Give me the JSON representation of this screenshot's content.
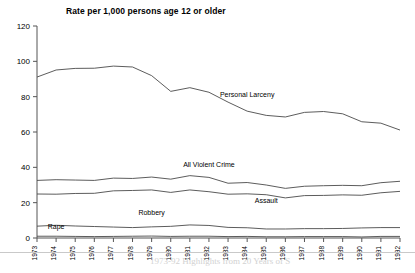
{
  "chart_data": {
    "type": "line",
    "title": "Rate per 1,000 persons age 12 or older",
    "xlabel": "",
    "ylabel": "",
    "ylim": [
      0,
      120
    ],
    "yticks": [
      0,
      20,
      40,
      60,
      80,
      100,
      120
    ],
    "grid": false,
    "legend": "inline-annotations",
    "categories": [
      "1973",
      "1974",
      "1975",
      "1976",
      "1977",
      "1978",
      "1979",
      "1980",
      "1981",
      "1982",
      "1983",
      "1984",
      "1985",
      "1986",
      "1987",
      "1988",
      "1989",
      "1990",
      "1991",
      "1992"
    ],
    "series": [
      {
        "name": "Personal Larceny",
        "values": [
          91.1,
          95.1,
          96.0,
          96.1,
          97.3,
          96.8,
          91.9,
          83.0,
          85.1,
          82.5,
          76.9,
          71.8,
          69.4,
          68.5,
          71.1,
          71.6,
          70.3,
          65.8,
          65.0,
          61.1
        ],
        "label_x_year": "1984",
        "label_value": 80
      },
      {
        "name": "All Violent Crime",
        "values": [
          32.6,
          33.0,
          32.8,
          32.6,
          33.9,
          33.7,
          34.5,
          33.3,
          35.3,
          34.3,
          31.0,
          31.4,
          30.0,
          28.1,
          29.3,
          29.6,
          29.8,
          29.6,
          31.3,
          32.1
        ],
        "label_x_year": "1982",
        "label_value": 40
      },
      {
        "name": "Assault",
        "values": [
          24.9,
          24.8,
          25.2,
          25.3,
          26.7,
          26.9,
          27.2,
          25.8,
          27.2,
          26.2,
          24.8,
          25.0,
          24.5,
          22.7,
          24.0,
          24.1,
          24.4,
          24.2,
          25.6,
          26.4
        ],
        "label_x_year": "1985",
        "label_value": 20
      },
      {
        "name": "Robbery",
        "values": [
          6.7,
          7.2,
          6.8,
          6.5,
          6.2,
          5.9,
          6.3,
          6.6,
          7.4,
          7.1,
          6.0,
          5.8,
          5.1,
          5.1,
          5.3,
          5.3,
          5.4,
          5.7,
          5.9,
          5.9
        ],
        "label_x_year": "1979",
        "label_value": 13
      },
      {
        "name": "Rape",
        "values": [
          1.0,
          1.0,
          0.9,
          0.8,
          0.9,
          1.0,
          1.1,
          0.9,
          1.0,
          1.0,
          0.8,
          0.9,
          0.7,
          0.7,
          0.8,
          0.8,
          0.8,
          0.6,
          0.9,
          0.9
        ],
        "label_x_year": "1974",
        "label_value": 5
      }
    ],
    "colors": {
      "line": "#4a4a4a",
      "axis": "#555555",
      "text": "#000000",
      "background": "#ffffff"
    }
  },
  "footer": {
    "ghost_text": "1973-92  Highlights from 20 Years of S"
  }
}
